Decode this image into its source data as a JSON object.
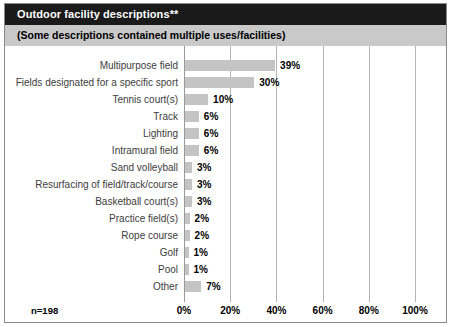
{
  "header": {
    "title": "Outdoor facility descriptions**",
    "subtitle": "(Some descriptions contained multiple uses/facilities)"
  },
  "footnote": "n=198",
  "chart_data": {
    "type": "bar",
    "orientation": "horizontal",
    "title": "Outdoor facility descriptions**",
    "subtitle": "(Some descriptions contained multiple uses/facilities)",
    "xlabel": "",
    "ylabel": "",
    "xlim": [
      0,
      100
    ],
    "xticks": [
      0,
      20,
      40,
      60,
      80,
      100
    ],
    "xticklabels": [
      "0%",
      "20%",
      "40%",
      "60%",
      "80%",
      "100%"
    ],
    "grid": true,
    "legend": false,
    "sample_size": "n=198",
    "bar_color": "#c4c4c4",
    "categories": [
      "Multipurpose field",
      "Fields designated for a specific sport",
      "Tennis court(s)",
      "Track",
      "Lighting",
      "Intramural field",
      "Sand volleyball",
      "Resurfacing of field/track/course",
      "Basketball court(s)",
      "Practice field(s)",
      "Rope course",
      "Golf",
      "Pool",
      "Other"
    ],
    "values": [
      39,
      30,
      10,
      6,
      6,
      6,
      3,
      3,
      3,
      2,
      2,
      1,
      1,
      7
    ],
    "value_labels": [
      "39%",
      "30%",
      "10%",
      "6%",
      "6%",
      "6%",
      "3%",
      "3%",
      "3%",
      "2%",
      "2%",
      "1%",
      "1%",
      "7%"
    ]
  }
}
